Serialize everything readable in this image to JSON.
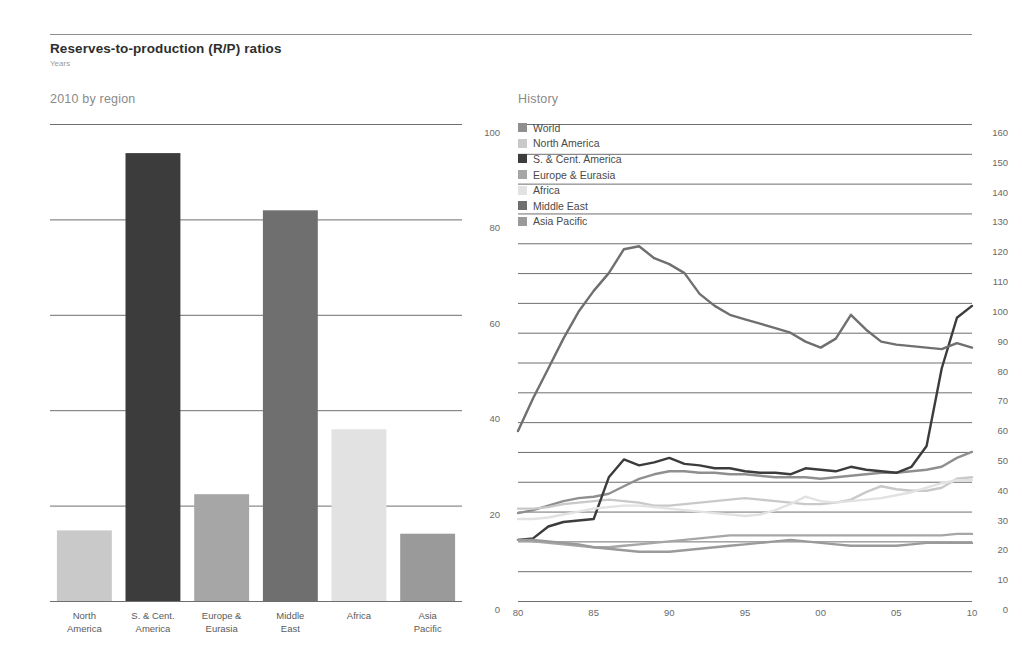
{
  "header": {
    "title": "Reserves-to-production (R/P) ratios",
    "subtitle": "Years"
  },
  "panels": {
    "left_title": "2010 by region",
    "right_title": "History"
  },
  "colors": {
    "world": "#8f8f8f",
    "north_america": "#c9c9c9",
    "s_cent_america": "#3c3c3c",
    "europe_eurasia": "#a6a6a6",
    "africa": "#e2e2e2",
    "middle_east": "#6f6f6f",
    "asia_pacific": "#9a9a9a",
    "rule": "#6f6f6f",
    "text": "#5a5a5a"
  },
  "legend": [
    {
      "label": "World",
      "color": "#8f8f8f"
    },
    {
      "label": "North America",
      "color": "#c9c9c9"
    },
    {
      "label": "S. & Cent. America",
      "color": "#3c3c3c"
    },
    {
      "label": "Europe & Eurasia",
      "color": "#a6a6a6"
    },
    {
      "label": "Africa",
      "color": "#e2e2e2"
    },
    {
      "label": "Middle East",
      "color": "#6f6f6f"
    },
    {
      "label": "Asia Pacific",
      "color": "#9a9a9a"
    }
  ],
  "chart_data": [
    {
      "type": "bar",
      "title": "2010 by region",
      "xlabel": "",
      "ylabel": "Years",
      "ylim": [
        0,
        100
      ],
      "yticks": [
        0,
        20,
        40,
        60,
        80,
        100
      ],
      "grid": true,
      "axis_position": "right",
      "categories": [
        "North America",
        "S. & Cent. America",
        "Europe & Eurasia",
        "Middle East",
        "Africa",
        "Asia Pacific"
      ],
      "category_lines": [
        [
          "North",
          "America"
        ],
        [
          "S. & Cent.",
          "America"
        ],
        [
          "Europe &",
          "Eurasia"
        ],
        [
          "Middle",
          "East"
        ],
        [
          "Africa",
          ""
        ],
        [
          "Asia",
          "Pacific"
        ]
      ],
      "values": [
        14.8,
        93.9,
        22.4,
        81.9,
        36.0,
        14.1
      ],
      "colors": [
        "#c9c9c9",
        "#3c3c3c",
        "#a6a6a6",
        "#6f6f6f",
        "#e2e2e2",
        "#9a9a9a"
      ]
    },
    {
      "type": "line",
      "title": "History",
      "xlabel": "",
      "ylabel": "Years",
      "ylim": [
        0,
        160
      ],
      "yticks": [
        0,
        10,
        20,
        30,
        40,
        50,
        60,
        70,
        80,
        90,
        100,
        110,
        120,
        130,
        140,
        150,
        160
      ],
      "xticks": [
        "80",
        "85",
        "90",
        "95",
        "00",
        "05",
        "10"
      ],
      "xlim": [
        1980,
        2010
      ],
      "grid": true,
      "axis_position": "right",
      "legend_position": "top-left",
      "x": [
        1980,
        1981,
        1982,
        1983,
        1984,
        1985,
        1986,
        1987,
        1988,
        1989,
        1990,
        1991,
        1992,
        1993,
        1994,
        1995,
        1996,
        1997,
        1998,
        1999,
        2000,
        2001,
        2002,
        2003,
        2004,
        2005,
        2006,
        2007,
        2008,
        2009,
        2010
      ],
      "series": [
        {
          "name": "World",
          "color": "#8f8f8f",
          "values": [
            29.5,
            30.5,
            32.0,
            33.5,
            34.5,
            35.0,
            36.0,
            38.5,
            41.0,
            42.5,
            43.5,
            43.5,
            43.0,
            43.0,
            42.5,
            42.5,
            42.0,
            41.5,
            41.5,
            41.5,
            41.0,
            41.5,
            42.0,
            42.5,
            43.0,
            43.0,
            43.5,
            44.0,
            45.0,
            48.0,
            50.0
          ]
        },
        {
          "name": "North America",
          "color": "#c9c9c9",
          "values": [
            31.0,
            31.0,
            31.5,
            32.5,
            33.0,
            33.5,
            34.0,
            33.5,
            33.0,
            32.0,
            32.0,
            32.5,
            33.0,
            33.5,
            34.0,
            34.5,
            34.0,
            33.5,
            33.0,
            32.5,
            32.5,
            33.0,
            34.0,
            36.5,
            38.5,
            37.5,
            37.0,
            37.0,
            38.0,
            41.0,
            41.5
          ]
        },
        {
          "name": "S. & Cent. America",
          "color": "#3c3c3c",
          "values": [
            20.5,
            21.0,
            25.0,
            26.5,
            27.0,
            27.5,
            41.5,
            47.5,
            45.5,
            46.5,
            48.0,
            46.0,
            45.5,
            44.5,
            44.5,
            43.5,
            43.0,
            43.0,
            42.5,
            44.5,
            44.0,
            43.5,
            45.0,
            44.0,
            43.5,
            43.0,
            45.0,
            52.0,
            78.0,
            95.0,
            99.0
          ]
        },
        {
          "name": "Europe & Eurasia",
          "color": "#a6a6a6",
          "values": [
            20.5,
            20.0,
            19.5,
            19.0,
            18.5,
            18.0,
            18.0,
            18.5,
            19.0,
            19.5,
            20.0,
            20.5,
            21.0,
            21.5,
            22.0,
            22.0,
            22.0,
            22.0,
            22.0,
            22.0,
            22.0,
            22.0,
            22.0,
            22.0,
            22.0,
            22.0,
            22.0,
            22.0,
            22.0,
            22.5,
            22.5
          ]
        },
        {
          "name": "Africa",
          "color": "#e2e2e2",
          "values": [
            27.5,
            27.5,
            28.0,
            29.0,
            30.0,
            31.0,
            31.5,
            32.0,
            32.0,
            31.5,
            31.0,
            30.5,
            30.0,
            29.5,
            29.0,
            28.5,
            29.0,
            30.5,
            32.5,
            35.0,
            33.5,
            33.0,
            33.5,
            34.0,
            34.5,
            35.5,
            36.5,
            38.0,
            39.5,
            40.5,
            40.5
          ]
        },
        {
          "name": "Middle East",
          "color": "#6f6f6f",
          "values": [
            57.0,
            68.0,
            78.0,
            88.0,
            97.0,
            104.0,
            110.0,
            118.0,
            119.0,
            115.0,
            113.0,
            110.0,
            103.0,
            99.0,
            96.0,
            94.5,
            93.0,
            91.5,
            90.0,
            87.0,
            85.0,
            88.0,
            96.0,
            91.0,
            87.0,
            86.0,
            85.5,
            85.0,
            84.5,
            86.5,
            85.0
          ]
        },
        {
          "name": "Asia Pacific",
          "color": "#9a9a9a",
          "values": [
            20.5,
            20.5,
            20.0,
            19.5,
            19.0,
            18.0,
            17.5,
            17.0,
            16.5,
            16.5,
            16.5,
            17.0,
            17.5,
            18.0,
            18.5,
            19.0,
            19.5,
            20.0,
            20.5,
            20.0,
            19.5,
            19.0,
            18.5,
            18.5,
            18.5,
            18.5,
            19.0,
            19.5,
            19.5,
            19.5,
            19.5
          ]
        }
      ]
    }
  ]
}
